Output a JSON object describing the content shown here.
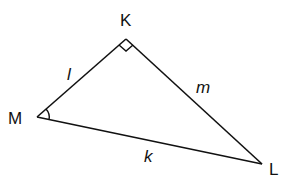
{
  "diagram": {
    "type": "right-triangle",
    "vertices": [
      {
        "name": "K",
        "label": "K",
        "right_angle": true
      },
      {
        "name": "M",
        "label": "M",
        "angle_marked": true
      },
      {
        "name": "L",
        "label": "L"
      }
    ],
    "sides": [
      {
        "between": "M-K",
        "label": "l"
      },
      {
        "between": "K-L",
        "label": "m"
      },
      {
        "between": "M-L",
        "label": "k"
      }
    ],
    "line_color": "#111111"
  }
}
